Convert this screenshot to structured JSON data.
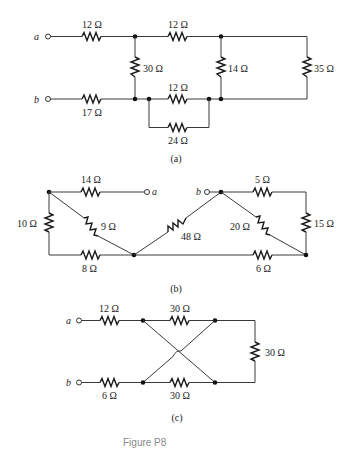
{
  "figure_caption": "Figure P8",
  "circuits": {
    "a": {
      "sublabel": "(a)",
      "terminals": [
        "a",
        "b"
      ],
      "resistors": {
        "top_left": "12 Ω",
        "top_mid": "12 Ω",
        "shunt_left": "30 Ω",
        "shunt_mid": "14 Ω",
        "shunt_right": "35 Ω",
        "bottom_left": "17 Ω",
        "bottom_mid": "12 Ω",
        "bottom_parallel": "24 Ω"
      }
    },
    "b": {
      "sublabel": "(b)",
      "terminals": [
        "a",
        "b"
      ],
      "resistors": {
        "top_left": "14 Ω",
        "left_vertical": "10 Ω",
        "diag_left": "9 Ω",
        "bottom_left": "8 Ω",
        "diag_center": "48 Ω",
        "top_right": "5 Ω",
        "diag_right": "20 Ω",
        "right_vertical": "15 Ω",
        "bottom_right": "6 Ω"
      }
    },
    "c": {
      "sublabel": "(c)",
      "terminals": [
        "a",
        "b"
      ],
      "resistors": {
        "top_left": "12 Ω",
        "top_mid": "30 Ω",
        "right_vertical": "30 Ω",
        "bottom_left": "6 Ω",
        "bottom_mid": "30 Ω"
      }
    }
  }
}
